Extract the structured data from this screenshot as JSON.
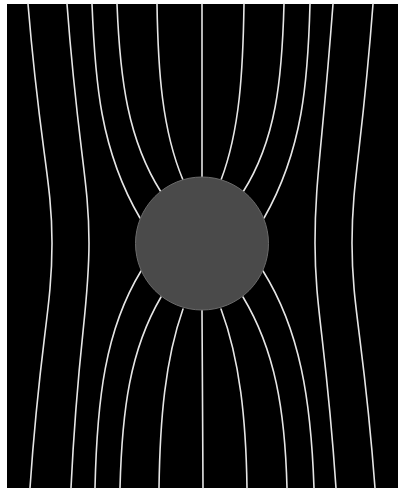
{
  "diagram": {
    "title": "",
    "colors": {
      "page_background": "#ffffff",
      "field_background": "#000000",
      "sphere_fill": "#4a4a4a",
      "sphere_stroke": "#6a6a6a",
      "field_line": "#e6e6e6"
    },
    "frame": {
      "x": 7,
      "y": 4,
      "width": 391,
      "height": 484
    },
    "sphere": {
      "cx": 202,
      "cy": 243.5,
      "r": 66.5
    },
    "field_lines": [
      {
        "id": "left-outer-1",
        "d": "M28,4 C40,150 52,180 52,243 C52,310 40,340 30,488"
      },
      {
        "id": "left-outer-2",
        "d": "M67,4 C78,150 89,180 89,243 C89,310 78,340 71,488"
      },
      {
        "id": "left-3-upper",
        "d": "M92,4 C95,80 100,150 140,218"
      },
      {
        "id": "left-3-lower",
        "d": "M141,271 C105,330 97,400 95,488"
      },
      {
        "id": "left-4-upper",
        "d": "M117,4 C120,80 128,140 161,192"
      },
      {
        "id": "left-4-lower",
        "d": "M161,297 C130,350 122,410 120,488"
      },
      {
        "id": "left-5-upper",
        "d": "M157,4 C158,70 162,130 183,180"
      },
      {
        "id": "left-5-lower",
        "d": "M183,309 C165,360 160,420 159,488"
      },
      {
        "id": "center-upper",
        "d": "M202,4 L202,177"
      },
      {
        "id": "center-lower",
        "d": "M202,310 L203,488"
      },
      {
        "id": "right-5-upper",
        "d": "M244,4 C243,70 240,130 221,180"
      },
      {
        "id": "right-5-lower",
        "d": "M221,309 C240,360 246,420 247,488"
      },
      {
        "id": "right-4-upper",
        "d": "M284,4 C282,80 276,140 243,192"
      },
      {
        "id": "right-4-lower",
        "d": "M243,297 C275,350 285,410 287,488"
      },
      {
        "id": "right-3-upper",
        "d": "M310,4 C308,80 303,150 264,218"
      },
      {
        "id": "right-3-lower",
        "d": "M263,271 C300,330 311,400 314,488"
      },
      {
        "id": "right-outer-2",
        "d": "M333,4 C322,150 315,180 315,243 C315,310 326,340 336,488"
      },
      {
        "id": "right-outer-1",
        "d": "M373,4 C362,150 352,180 352,243 C352,310 364,340 375,488"
      }
    ]
  }
}
